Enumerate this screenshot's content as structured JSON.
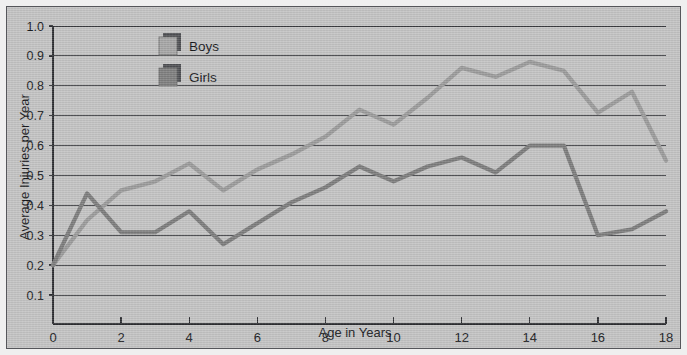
{
  "chart_data": {
    "type": "line",
    "title": "",
    "xlabel": "Age in Years",
    "ylabel": "Average Injuries per Year",
    "xlim": [
      0,
      18
    ],
    "ylim": [
      0,
      1.0
    ],
    "grid": true,
    "legend_position": "top-left-inside",
    "x": [
      0,
      1,
      2,
      3,
      4,
      5,
      6,
      7,
      8,
      9,
      10,
      11,
      12,
      13,
      14,
      15,
      16,
      17,
      18
    ],
    "xtick_labels": [
      "0",
      "2",
      "4",
      "6",
      "8",
      "10",
      "12",
      "14",
      "16",
      "18"
    ],
    "xtick_values": [
      0,
      2,
      4,
      6,
      8,
      10,
      12,
      14,
      16,
      18
    ],
    "ytick_labels": [
      "0.1",
      "0.2",
      "0.3",
      "0.4",
      "0.5",
      "0.6",
      "0.7",
      "0.8",
      "0.9",
      "1.0"
    ],
    "ytick_values": [
      0.1,
      0.2,
      0.3,
      0.4,
      0.5,
      0.6,
      0.7,
      0.8,
      0.9,
      1.0
    ],
    "series": [
      {
        "name": "Boys",
        "color": "#9a9a9a",
        "values": [
          0.2,
          0.35,
          0.45,
          0.48,
          0.54,
          0.45,
          0.52,
          0.57,
          0.63,
          0.72,
          0.67,
          0.76,
          0.86,
          0.83,
          0.88,
          0.85,
          0.71,
          0.78,
          0.55
        ]
      },
      {
        "name": "Girls",
        "color": "#7b7b7b",
        "values": [
          0.2,
          0.44,
          0.31,
          0.31,
          0.38,
          0.27,
          0.34,
          0.41,
          0.46,
          0.53,
          0.48,
          0.53,
          0.56,
          0.51,
          0.6,
          0.6,
          0.3,
          0.32,
          0.38
        ]
      }
    ]
  },
  "legend": {
    "entries": [
      {
        "label": "Boys",
        "swatch_color": "#a5a5a5"
      },
      {
        "label": "Girls",
        "swatch_color": "#7e7e7e"
      }
    ]
  },
  "colors": {
    "background": "#c3c3c3",
    "page": "#efefef",
    "border": "#55565a",
    "grid": "#3a3b3f",
    "axis": "#2b2c30",
    "text": "#17181b"
  }
}
